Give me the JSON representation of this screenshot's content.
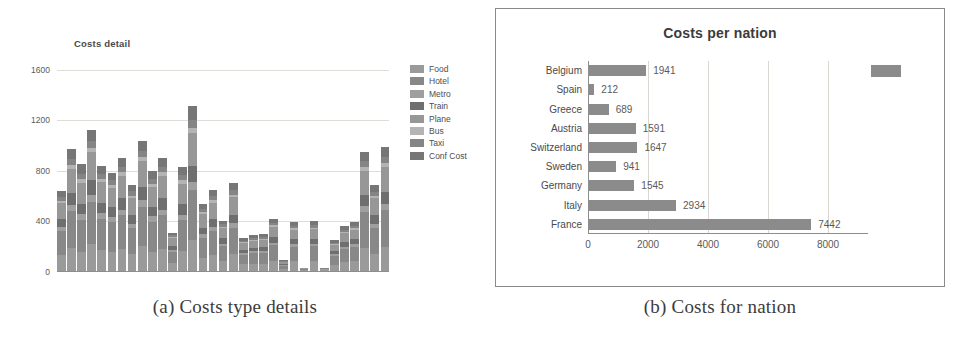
{
  "figure": {
    "caption_a": "(a) Costs type details",
    "caption_b": "(b) Costs for nation"
  },
  "panel_a": {
    "title": "Costs detail",
    "legend_title": "",
    "chart_data": {
      "type": "bar",
      "subtype": "stacked-bar",
      "title": "Costs detail",
      "xlabel": "",
      "ylabel": "",
      "ylim": [
        0,
        1600
      ],
      "yticks": [
        0,
        400,
        800,
        1200,
        1600
      ],
      "grid": true,
      "legend_position": "right",
      "categories": [
        "1",
        "2",
        "3",
        "4",
        "5",
        "6",
        "7",
        "8",
        "9",
        "10",
        "11",
        "12",
        "13",
        "14",
        "15",
        "16",
        "17",
        "18",
        "19",
        "20",
        "21",
        "22",
        "23",
        "24",
        "25",
        "26",
        "27",
        "28",
        "29",
        "30"
      ],
      "totals": [
        630,
        960,
        840,
        1115,
        830,
        775,
        890,
        680,
        1030,
        790,
        890,
        300,
        820,
        1300,
        530,
        640,
        395,
        690,
        255,
        280,
        290,
        410,
        80,
        385,
        20,
        390,
        18,
        240,
        350,
        385,
        940,
        680,
        975
      ],
      "series": [
        {
          "name": "Food",
          "color": "#9a9a9a",
          "values": [
            120,
            180,
            150,
            210,
            160,
            150,
            170,
            130,
            195,
            150,
            170,
            60,
            155,
            245,
            100,
            120,
            75,
            130,
            48,
            53,
            55,
            78,
            15,
            73,
            4,
            74,
            3,
            45,
            66,
            73,
            178,
            129,
            185
          ]
        },
        {
          "name": "Hotel",
          "color": "#888888",
          "values": [
            190,
            290,
            253,
            336,
            250,
            233,
            268,
            205,
            310,
            238,
            268,
            90,
            247,
            391,
            160,
            193,
            119,
            208,
            77,
            84,
            87,
            123,
            24,
            116,
            6,
            117,
            5,
            72,
            105,
            116,
            283,
            205,
            293
          ]
        },
        {
          "name": "Metro",
          "color": "#9f9f9f",
          "values": [
            32,
            48,
            42,
            56,
            42,
            39,
            45,
            34,
            52,
            40,
            45,
            15,
            41,
            65,
            27,
            32,
            20,
            35,
            13,
            14,
            15,
            21,
            4,
            19,
            1,
            20,
            1,
            12,
            18,
            19,
            47,
            34,
            49
          ]
        },
        {
          "name": "Train",
          "color": "#6f6f6f",
          "values": [
            63,
            96,
            84,
            112,
            83,
            78,
            89,
            68,
            103,
            79,
            89,
            30,
            82,
            130,
            53,
            64,
            40,
            69,
            26,
            28,
            29,
            41,
            8,
            39,
            2,
            39,
            2,
            24,
            35,
            39,
            94,
            68,
            98
          ]
        },
        {
          "name": "Plane",
          "color": "#979797",
          "values": [
            126,
            192,
            168,
            223,
            166,
            155,
            178,
            136,
            206,
            158,
            178,
            60,
            164,
            260,
            106,
            128,
            79,
            138,
            51,
            56,
            58,
            82,
            16,
            77,
            4,
            78,
            4,
            48,
            70,
            77,
            188,
            136,
            195
          ]
        },
        {
          "name": "Bus",
          "color": "#b4b4b4",
          "values": [
            19,
            29,
            25,
            33,
            25,
            23,
            27,
            20,
            31,
            24,
            27,
            9,
            25,
            39,
            16,
            19,
            12,
            21,
            8,
            8,
            9,
            12,
            2,
            12,
            1,
            12,
            1,
            7,
            11,
            12,
            28,
            20,
            29
          ]
        },
        {
          "name": "Taxi",
          "color": "#858585",
          "values": [
            32,
            48,
            42,
            56,
            42,
            39,
            45,
            34,
            52,
            40,
            45,
            15,
            41,
            65,
            27,
            32,
            20,
            35,
            13,
            14,
            15,
            21,
            4,
            19,
            1,
            20,
            1,
            12,
            18,
            19,
            47,
            34,
            49
          ]
        },
        {
          "name": "Conf Cost",
          "color": "#767676",
          "values": [
            48,
            77,
            76,
            89,
            62,
            58,
            68,
            53,
            81,
            61,
            68,
            21,
            65,
            105,
            41,
            52,
            30,
            54,
            19,
            23,
            22,
            32,
            7,
            30,
            1,
            30,
            1,
            20,
            27,
            30,
            75,
            54,
            77
          ]
        }
      ]
    }
  },
  "panel_b": {
    "title": "Costs per nation",
    "chart_data": {
      "type": "bar",
      "subtype": "horizontal-bar",
      "title": "Costs per nation",
      "xlabel": "",
      "ylabel": "",
      "xlim": [
        0,
        9000
      ],
      "xticks": [
        0,
        2000,
        4000,
        6000,
        8000
      ],
      "grid": true,
      "bar_color": "#8b8b8b",
      "categories": [
        "Belgium",
        "Spain",
        "Greece",
        "Austria",
        "Switzerland",
        "Sweden",
        "Germany",
        "Italy",
        "France"
      ],
      "values": [
        1941,
        212,
        689,
        1591,
        1647,
        941,
        1545,
        2934,
        7442
      ],
      "data_labels": [
        "1941",
        "212",
        "689",
        "1591",
        "1647",
        "941",
        "1545",
        "2934",
        "7442"
      ]
    }
  }
}
